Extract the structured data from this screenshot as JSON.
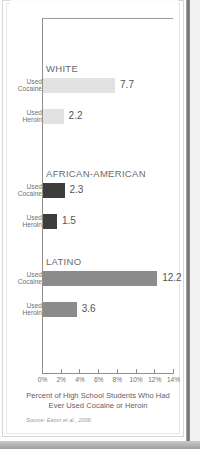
{
  "chart_data": {
    "type": "bar",
    "orientation": "horizontal",
    "title": "",
    "xlabel": "Percent of High School Students Who Had Ever Used Cocaine or Heroin",
    "ylabel": "",
    "xlim": [
      0,
      14
    ],
    "xtick_labels": [
      "0%",
      "2%",
      "4%",
      "6%",
      "8%",
      "10%",
      "12%",
      "14%"
    ],
    "xtick_values": [
      0,
      2,
      4,
      6,
      8,
      10,
      12,
      14
    ],
    "grid": false,
    "legend": "none",
    "source": "Source: Eaton et al., 2006.",
    "groups": [
      {
        "name": "WHITE",
        "color": "#e2e2e2",
        "bars": [
          {
            "label_line1": "Used",
            "label_line2": "Cocaine",
            "value": 7.7,
            "value_label": "7.7"
          },
          {
            "label_line1": "Used",
            "label_line2": "Heroin",
            "value": 2.2,
            "value_label": "2.2"
          }
        ]
      },
      {
        "name": "AFRICAN-AMERICAN",
        "color": "#3d3d3d",
        "bars": [
          {
            "label_line1": "Used",
            "label_line2": "Cocaine",
            "value": 2.3,
            "value_label": "2.3"
          },
          {
            "label_line1": "Used",
            "label_line2": "Heroin",
            "value": 1.5,
            "value_label": "1.5"
          }
        ]
      },
      {
        "name": "LATINO",
        "color": "#8b8b8b",
        "bars": [
          {
            "label_line1": "Used",
            "label_line2": "Cocaine",
            "value": 12.2,
            "value_label": "12.2"
          },
          {
            "label_line1": "Used",
            "label_line2": "Heroin",
            "value": 3.6,
            "value_label": "3.6"
          }
        ]
      }
    ]
  }
}
